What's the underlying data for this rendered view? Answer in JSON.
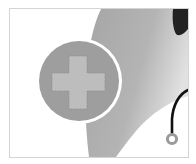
{
  "illustration": {
    "subject": "medical-cross-with-doctor-and-stethoscope",
    "colors": {
      "background": "#ffffff",
      "frame_border": "#d4d4d4",
      "body_shape": "#a9a9a9",
      "body_shape_light": "#d6d6d6",
      "badge_fill": "#9e9e9e",
      "badge_ring": "#ffffff",
      "cross_fill": "#bdbdbd",
      "cross_stitch": "#8a8a8a",
      "hair": "#222222",
      "stethoscope_tube": "#111111",
      "stethoscope_ring": "#9a9a9a"
    }
  }
}
